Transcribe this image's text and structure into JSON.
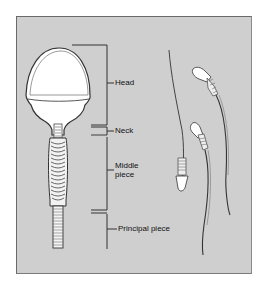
{
  "diagram": {
    "labels": {
      "head": "Head",
      "neck": "Neck",
      "middle_piece_line1": "Middle",
      "middle_piece_line2": "piece",
      "principal_piece": "Principal piece"
    },
    "colors": {
      "background": "#ffffff",
      "panel": "#cfcfcf",
      "line": "#333333",
      "cell_fill": "#ffffff"
    }
  }
}
